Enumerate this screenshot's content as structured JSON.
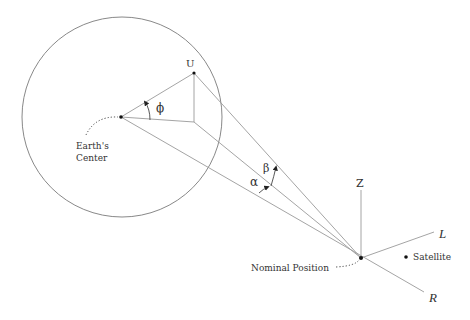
{
  "diagram": {
    "labels": {
      "earth_center_line1": "Earth's",
      "earth_center_line2": "Center",
      "point_u": "U",
      "angle_phi": "ϕ",
      "angle_alpha": "α",
      "angle_beta": "β",
      "axis_z": "Z",
      "axis_l": "L",
      "axis_r": "R",
      "nominal_position": "Nominal Position",
      "satellite": "Satellite"
    },
    "geometry": {
      "earth_circle": {
        "cx": 122,
        "cy": 117,
        "r": 100
      },
      "earth_center": [
        121,
        117
      ],
      "point_u": [
        194,
        73
      ],
      "u_foot": [
        194,
        122
      ],
      "nominal_position": [
        361,
        258
      ],
      "satellite": [
        406,
        257
      ],
      "z_axis_top": [
        361,
        190
      ],
      "l_axis_end": [
        434,
        232
      ],
      "r_axis_end": [
        424,
        292
      ]
    },
    "colors": {
      "line": "#9a9a9a",
      "circle": "#7a7a7a",
      "text": "#333333",
      "point": "#111111"
    }
  }
}
